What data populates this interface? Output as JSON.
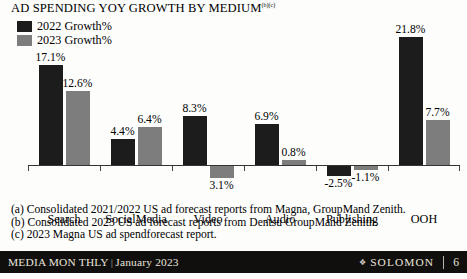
{
  "title": {
    "text": "AD SPENDING YOY GROWTH BY MEDIUM",
    "superscript": "(b)(c)"
  },
  "legend": {
    "items": [
      {
        "label": "2022 Growth%",
        "color": "#1c1c1c"
      },
      {
        "label": "2023 Growth%",
        "color": "#7d7d7d"
      }
    ]
  },
  "chart_data": {
    "type": "bar",
    "title": "AD SPENDING YOY GROWTH BY MEDIUM",
    "xlabel": "",
    "ylabel": "",
    "grid": false,
    "legend_position": "top-left",
    "ylim": [
      -4,
      23
    ],
    "categories": [
      "Search",
      "SocialMedia",
      "Video",
      "Audio",
      "Publishing",
      "OOH"
    ],
    "series": [
      {
        "name": "2022 Growth%",
        "color": "#1c1c1c",
        "values": [
          17.1,
          4.4,
          8.3,
          6.9,
          -2.5,
          21.8
        ],
        "labels": [
          "17.1%",
          "4.4%",
          "8.3%",
          "6.9%",
          "-2.5%",
          "21.8%"
        ]
      },
      {
        "name": "2023 Growth%",
        "color": "#7d7d7d",
        "values": [
          12.6,
          6.4,
          -3.1,
          0.8,
          -1.1,
          7.7
        ],
        "labels": [
          "12.6%",
          "6.4%",
          "3.1%",
          "0.8%",
          "-1.1%",
          "7.7%"
        ]
      }
    ]
  },
  "footnotes": [
    "(a) Consolidated 2021/2022 US ad forecast reports from Magna, GroupMand Zenith.",
    "(b) Consolidated 2023 US ad forecast reports from Dentsu GroupMand Zenith.",
    "(c) 2023 Magna US ad spendforecast report."
  ],
  "footer": {
    "publication": "MEDIA  MON THLY",
    "separator": "|",
    "issue": "January 2023",
    "brand_mark": "❖",
    "brand": "SOLOMON",
    "page": "6"
  },
  "colors": {
    "series_2022": "#1c1c1c",
    "series_2023": "#7d7d7d",
    "footer_background": "#100f0e",
    "footer_text": "#e8e4dc",
    "axis": "#333333"
  }
}
